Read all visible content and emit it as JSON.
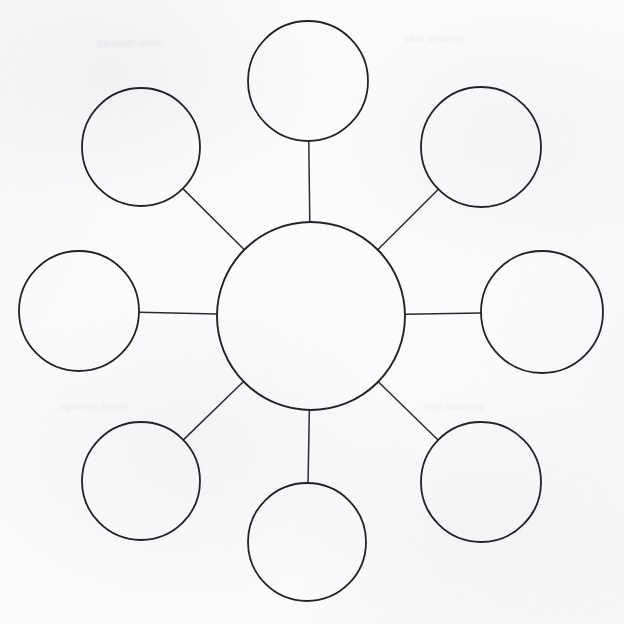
{
  "worksheet": {
    "title": "Spider Diagram Worksheet",
    "kind": "blank-concept-map",
    "medium": "scanned paper",
    "background_color": "#fbfbfc",
    "ink_color": "#222229",
    "central_node": {
      "label": "",
      "cx": 311,
      "cy": 316,
      "r": 94
    },
    "satellites": [
      {
        "name": "top",
        "label": "",
        "cx": 308,
        "cy": 81,
        "r": 60
      },
      {
        "name": "top-left",
        "label": "",
        "cx": 141,
        "cy": 147,
        "r": 59
      },
      {
        "name": "top-right",
        "label": "",
        "cx": 481,
        "cy": 147,
        "r": 60
      },
      {
        "name": "left",
        "label": "",
        "cx": 79,
        "cy": 311,
        "r": 60
      },
      {
        "name": "right",
        "label": "",
        "cx": 542,
        "cy": 312,
        "r": 61
      },
      {
        "name": "bottom-left",
        "label": "",
        "cx": 141,
        "cy": 481,
        "r": 59
      },
      {
        "name": "bottom-right",
        "label": "",
        "cx": 481,
        "cy": 482,
        "r": 60
      },
      {
        "name": "bottom",
        "label": "",
        "cx": 307,
        "cy": 542,
        "r": 59
      }
    ],
    "ghost_text": [
      {
        "text": "show through",
        "x": 96,
        "y": 36
      },
      {
        "text": "reverse side",
        "x": 404,
        "y": 32
      },
      {
        "text": "bleed through",
        "x": 58,
        "y": 400
      },
      {
        "text": "printed text",
        "x": 424,
        "y": 400
      }
    ]
  }
}
